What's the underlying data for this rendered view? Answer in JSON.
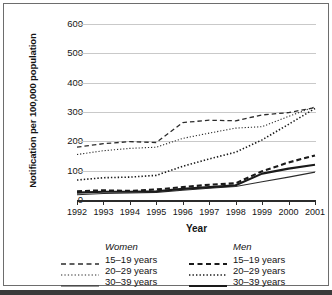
{
  "chart_data": {
    "type": "line",
    "title": "",
    "xlabel": "Year",
    "ylabel": "Notification per 100,000 population",
    "x": [
      1992,
      1993,
      1994,
      1995,
      1996,
      1997,
      1998,
      1999,
      2000,
      2001
    ],
    "xtick_labels": [
      "1992",
      "1993",
      "1994",
      "1995",
      "1996",
      "1997",
      "1998",
      "1999",
      "2000",
      "2001"
    ],
    "ytick_labels": [
      "0",
      "100",
      "200",
      "300",
      "400",
      "500",
      "600"
    ],
    "yticks": [
      0,
      100,
      200,
      300,
      400,
      500,
      600
    ],
    "ylim": [
      0,
      600
    ],
    "xlim": [
      1992,
      2001
    ],
    "grid": "horizontal",
    "legend_position": "below-plot",
    "series": [
      {
        "name": "Women 15–19 years",
        "group": "Women",
        "age": "15–19 years",
        "style": "dashed",
        "width": 1.3,
        "color": "#2b2b2b",
        "values": [
          180,
          192,
          199,
          196,
          264,
          272,
          270,
          290,
          298,
          315
        ]
      },
      {
        "name": "Women 20–29 years",
        "group": "Women",
        "age": "20–29 years",
        "style": "dotted",
        "width": 1.1,
        "color": "#2b2b2b",
        "values": [
          155,
          168,
          176,
          180,
          210,
          228,
          245,
          250,
          285,
          318
        ]
      },
      {
        "name": "Women 30–39 years",
        "group": "Women",
        "age": "30–39 years",
        "style": "solid",
        "width": 1.1,
        "color": "#2b2b2b",
        "values": [
          18,
          22,
          24,
          26,
          33,
          40,
          46,
          62,
          78,
          95
        ]
      },
      {
        "name": "Men 15–19 years",
        "group": "Men",
        "age": "15–19 years",
        "style": "dashed",
        "width": 2.1,
        "color": "#1a1a1a",
        "values": [
          30,
          33,
          31,
          36,
          44,
          52,
          57,
          98,
          128,
          152
        ]
      },
      {
        "name": "Men 20–29 years",
        "group": "Men",
        "age": "20–29 years",
        "style": "dotted",
        "width": 1.6,
        "color": "#1a1a1a",
        "values": [
          68,
          76,
          78,
          84,
          115,
          140,
          163,
          205,
          258,
          312
        ]
      },
      {
        "name": "Men 30–39 years",
        "group": "Men",
        "age": "30–39 years",
        "style": "solid",
        "width": 2.1,
        "color": "#1a1a1a",
        "values": [
          25,
          28,
          28,
          30,
          38,
          44,
          50,
          90,
          107,
          120
        ]
      }
    ],
    "annotations": []
  },
  "legend": {
    "women": {
      "title": "Women",
      "entries": [
        {
          "label": "15–19 years",
          "swatch": "dashed-thin-line-icon"
        },
        {
          "label": "20–29 years",
          "swatch": "dotted-thin-line-icon"
        },
        {
          "label": "30–39 years",
          "swatch": "solid-thin-line-icon"
        }
      ]
    },
    "men": {
      "title": "Men",
      "entries": [
        {
          "label": "15–19 years",
          "swatch": "dashed-thick-line-icon"
        },
        {
          "label": "20–29 years",
          "swatch": "dotted-thick-line-icon"
        },
        {
          "label": "30–39 years",
          "swatch": "solid-thick-line-icon"
        }
      ]
    }
  },
  "colors": {
    "gridline": "#c9c9c9",
    "axis": "#2b2b2b",
    "text": "#141414",
    "frame": "#6d6d6d",
    "figure_rule": "#3a3a3a",
    "background": "#ffffff"
  }
}
